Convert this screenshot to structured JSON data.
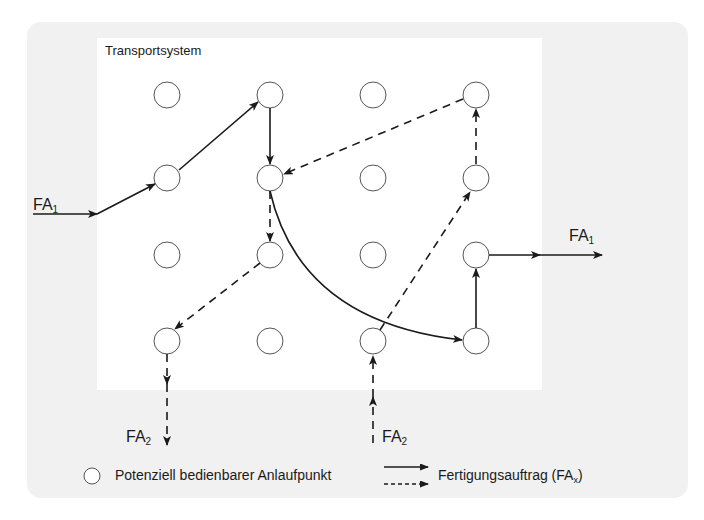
{
  "diagram": {
    "title": "Transportsystem",
    "grid": {
      "columns_x": [
        167,
        270,
        373,
        476
      ],
      "rows_y": [
        95,
        178,
        255,
        341
      ],
      "node_radius": 13
    },
    "labels": {
      "fa1_in": {
        "base": "FA",
        "sub": "1"
      },
      "fa1_out": {
        "base": "FA",
        "sub": "1"
      },
      "fa2_out": {
        "base": "FA",
        "sub": "2"
      },
      "fa2_in": {
        "base": "FA",
        "sub": "2"
      }
    },
    "routes": [
      {
        "order": "FA1",
        "style": "solid",
        "path": [
          "in-left",
          "node(1,2)",
          "node(2,1)",
          "node(2,2)",
          "node(4,4)",
          "node(4,3)",
          "out-right"
        ]
      },
      {
        "order": "FA2",
        "style": "dashed",
        "path": [
          "in-bottom",
          "node(3,4)",
          "node(4,2)",
          "node(4,1)",
          "node(2,2)",
          "node(2,3)",
          "node(1,4)",
          "out-bottom"
        ]
      }
    ]
  },
  "legend": {
    "node_label": "Potenziell bedienbarer Anlaufpunkt",
    "order_label_base": "Fertigungsauftrag (FA",
    "order_label_sub": "x",
    "order_label_end": ")"
  },
  "colors": {
    "outer_panel": "#f1f1f1",
    "inner_panel": "#ffffff",
    "stroke": "#1a1a1a",
    "node_stroke": "#555555"
  }
}
